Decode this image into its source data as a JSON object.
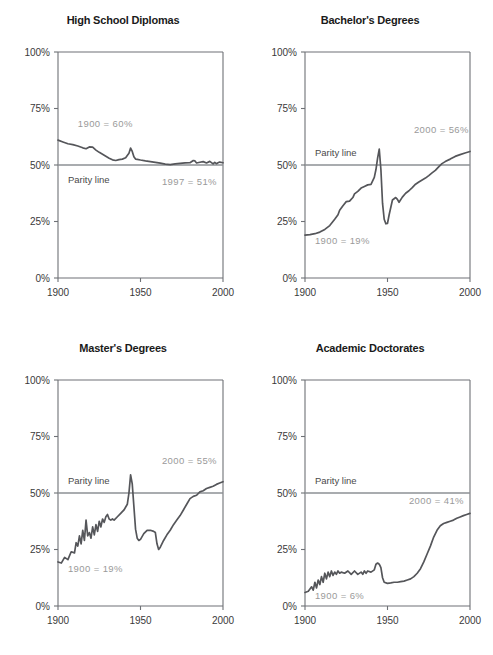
{
  "figure": {
    "width": 493,
    "height": 655,
    "background": "#ffffff",
    "line_color": "#55565a",
    "axis_color": "#6e7176",
    "parity_color": "#8d9095",
    "annotation_light_color": "#9a9a9a",
    "annotation_strong_color": "#4a4a4a",
    "tick_label_color": "#3a3a3a"
  },
  "axes": {
    "y_ticks": [
      "0%",
      "25%",
      "50%",
      "75%",
      "100%"
    ],
    "y_tick_values": [
      0,
      25,
      50,
      75,
      100
    ],
    "x_ticks": [
      "1900",
      "1950",
      "2000"
    ],
    "x_tick_values": [
      1900,
      1950,
      2000
    ],
    "xlim": [
      1900,
      2000
    ],
    "ylim": [
      0,
      100
    ]
  },
  "labels": {
    "parity_line": "Parity line"
  },
  "chart_data": [
    {
      "id": "high-school-diplomas",
      "type": "line",
      "title": "High School Diplomas",
      "xlabel": "",
      "ylabel": "",
      "xlim": [
        1900,
        2000
      ],
      "ylim": [
        0,
        100
      ],
      "grid": false,
      "legend": "none",
      "parity_line": 50,
      "annotations": [
        {
          "text": "1900 = 60%",
          "x": 1912,
          "y": 67,
          "style": "light"
        },
        {
          "text": "Parity line",
          "x": 1906,
          "y": 42,
          "style": "strong"
        },
        {
          "text": "1997 = 51%",
          "x": 1963,
          "y": 41,
          "style": "light"
        }
      ],
      "x": [
        1900,
        1903,
        1906,
        1909,
        1912,
        1915,
        1917,
        1919,
        1921,
        1923,
        1925,
        1928,
        1931,
        1933,
        1935,
        1937,
        1939,
        1941,
        1943,
        1944,
        1945,
        1946,
        1947,
        1948,
        1950,
        1953,
        1956,
        1959,
        1962,
        1965,
        1968,
        1971,
        1974,
        1977,
        1980,
        1982,
        1983,
        1984,
        1986,
        1988,
        1990,
        1992,
        1994,
        1995,
        1996,
        1997,
        1998,
        2000
      ],
      "values": [
        61.0,
        60.2,
        59.4,
        59.0,
        58.4,
        57.6,
        57.2,
        58.0,
        57.9,
        56.6,
        55.6,
        54.3,
        53.0,
        52.3,
        52.0,
        52.4,
        52.6,
        53.2,
        55.2,
        57.5,
        56.0,
        53.6,
        52.6,
        52.5,
        52.2,
        51.8,
        51.5,
        51.2,
        50.8,
        50.4,
        50.2,
        50.5,
        50.7,
        50.9,
        51.0,
        52.0,
        51.8,
        50.9,
        51.2,
        51.5,
        50.9,
        51.6,
        50.5,
        51.2,
        50.6,
        51.0,
        51.3,
        51.0
      ]
    },
    {
      "id": "bachelors-degrees",
      "type": "line",
      "title": "Bachelor's Degrees",
      "xlabel": "",
      "ylabel": "",
      "xlim": [
        1900,
        2000
      ],
      "ylim": [
        0,
        100
      ],
      "grid": false,
      "legend": "none",
      "parity_line": 50,
      "annotations": [
        {
          "text": "2000 = 56%",
          "x": 1966,
          "y": 64,
          "style": "light"
        },
        {
          "text": "Parity line",
          "x": 1906,
          "y": 54,
          "style": "strong"
        },
        {
          "text": "1900 = 19%",
          "x": 1906,
          "y": 15,
          "style": "light"
        }
      ],
      "x": [
        1900,
        1903,
        1906,
        1909,
        1912,
        1915,
        1918,
        1920,
        1921,
        1923,
        1925,
        1927,
        1929,
        1930,
        1932,
        1934,
        1936,
        1938,
        1940,
        1942,
        1943,
        1944,
        1945,
        1946,
        1947,
        1948,
        1949,
        1950,
        1951,
        1953,
        1955,
        1956,
        1957,
        1959,
        1961,
        1963,
        1965,
        1967,
        1969,
        1971,
        1973,
        1975,
        1977,
        1979,
        1981,
        1983,
        1985,
        1988,
        1991,
        1994,
        1997,
        2000
      ],
      "values": [
        19.0,
        19.2,
        19.6,
        20.3,
        21.5,
        23.2,
        26.0,
        28.0,
        30.0,
        32.0,
        33.8,
        34.0,
        35.6,
        37.2,
        38.3,
        39.8,
        40.5,
        41.2,
        41.4,
        44.5,
        48.0,
        53.0,
        57.0,
        48.0,
        33.0,
        26.0,
        24.0,
        24.2,
        28.0,
        34.5,
        35.6,
        34.8,
        33.5,
        35.8,
        37.5,
        38.6,
        40.0,
        41.5,
        42.5,
        43.4,
        44.2,
        45.3,
        46.5,
        47.6,
        49.2,
        50.6,
        51.5,
        52.6,
        53.8,
        54.6,
        55.3,
        56.0
      ]
    },
    {
      "id": "masters-degrees",
      "type": "line",
      "title": "Master's Degrees",
      "xlabel": "",
      "ylabel": "",
      "xlim": [
        1900,
        2000
      ],
      "ylim": [
        0,
        100
      ],
      "grid": false,
      "legend": "none",
      "parity_line": 50,
      "annotations": [
        {
          "text": "2000 = 55%",
          "x": 1963,
          "y": 63,
          "style": "light"
        },
        {
          "text": "Parity line",
          "x": 1906,
          "y": 54,
          "style": "strong"
        },
        {
          "text": "1900 = 19%",
          "x": 1906,
          "y": 15,
          "style": "light"
        }
      ],
      "x": [
        1900,
        1902,
        1904,
        1906,
        1908,
        1910,
        1911,
        1912,
        1913,
        1914,
        1915,
        1916,
        1917,
        1918,
        1919,
        1920,
        1921,
        1922,
        1923,
        1924,
        1925,
        1926,
        1927,
        1928,
        1929,
        1930,
        1931,
        1932,
        1933,
        1934,
        1936,
        1938,
        1940,
        1942,
        1943,
        1944,
        1945,
        1946,
        1947,
        1948,
        1949,
        1950,
        1952,
        1954,
        1956,
        1958,
        1959,
        1960,
        1961,
        1962,
        1964,
        1966,
        1968,
        1970,
        1972,
        1974,
        1976,
        1978,
        1980,
        1982,
        1984,
        1986,
        1988,
        1990,
        1992,
        1994,
        1996,
        1998,
        2000
      ],
      "values": [
        19.5,
        19.0,
        21.5,
        20.5,
        24.0,
        23.5,
        28.0,
        26.5,
        31.0,
        27.5,
        33.5,
        29.0,
        38.0,
        31.0,
        32.5,
        30.0,
        35.0,
        31.5,
        36.0,
        33.0,
        37.5,
        35.0,
        38.5,
        37.0,
        39.5,
        40.5,
        38.5,
        38.0,
        38.5,
        38.0,
        39.5,
        41.0,
        42.5,
        45.0,
        50.0,
        58.0,
        54.0,
        44.0,
        34.0,
        30.0,
        29.0,
        29.5,
        32.0,
        33.5,
        33.5,
        33.0,
        32.5,
        27.5,
        25.0,
        26.0,
        29.0,
        31.5,
        33.5,
        36.0,
        38.0,
        40.0,
        42.5,
        45.0,
        47.5,
        48.5,
        49.0,
        50.5,
        51.0,
        52.0,
        52.5,
        53.0,
        53.8,
        54.4,
        55.0
      ]
    },
    {
      "id": "academic-doctorates",
      "type": "line",
      "title": "Academic Doctorates",
      "xlabel": "",
      "ylabel": "",
      "xlim": [
        1900,
        2000
      ],
      "ylim": [
        0,
        100
      ],
      "grid": false,
      "legend": "none",
      "parity_line": 50,
      "annotations": [
        {
          "text": "Parity line",
          "x": 1906,
          "y": 54,
          "style": "strong"
        },
        {
          "text": "2000 = 41%",
          "x": 1963,
          "y": 45,
          "style": "light"
        },
        {
          "text": "1900 = 6%",
          "x": 1906,
          "y": 3,
          "style": "light"
        }
      ],
      "x": [
        1900,
        1902,
        1904,
        1905,
        1906,
        1907,
        1908,
        1909,
        1910,
        1911,
        1912,
        1913,
        1914,
        1915,
        1916,
        1917,
        1918,
        1919,
        1920,
        1921,
        1922,
        1924,
        1926,
        1928,
        1930,
        1932,
        1934,
        1935,
        1936,
        1937,
        1938,
        1940,
        1942,
        1943,
        1944,
        1945,
        1946,
        1947,
        1948,
        1950,
        1952,
        1954,
        1956,
        1958,
        1960,
        1962,
        1964,
        1966,
        1968,
        1970,
        1972,
        1974,
        1976,
        1978,
        1980,
        1982,
        1984,
        1986,
        1988,
        1990,
        1992,
        1994,
        1996,
        1998,
        2000
      ],
      "values": [
        6.0,
        6.5,
        8.5,
        7.0,
        10.5,
        8.0,
        11.5,
        9.5,
        13.0,
        10.5,
        14.5,
        12.0,
        15.0,
        13.0,
        15.5,
        13.5,
        15.0,
        14.0,
        15.5,
        14.5,
        15.0,
        14.5,
        15.5,
        14.0,
        15.5,
        14.0,
        15.0,
        14.0,
        15.5,
        14.5,
        15.5,
        15.0,
        16.0,
        18.5,
        19.0,
        18.5,
        17.0,
        12.5,
        10.5,
        10.0,
        10.2,
        10.5,
        10.5,
        10.8,
        11.0,
        11.5,
        12.0,
        13.0,
        14.5,
        16.5,
        19.5,
        23.0,
        26.5,
        30.5,
        33.5,
        35.5,
        36.5,
        37.0,
        37.5,
        38.0,
        38.8,
        39.4,
        40.0,
        40.5,
        41.0
      ]
    }
  ]
}
